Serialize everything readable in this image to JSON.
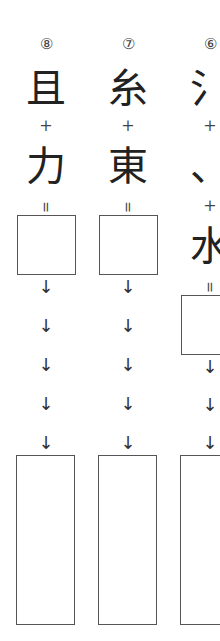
{
  "columns": [
    {
      "number": "⑧",
      "parts": [
        "且",
        "+",
        "力"
      ],
      "equals": "=",
      "arrow": "↓",
      "answer_box": "",
      "final_box": ""
    },
    {
      "number": "⑦",
      "parts": [
        "糸",
        "+",
        "東"
      ],
      "equals": "=",
      "arrow": "↓",
      "answer_box": "",
      "final_box": ""
    },
    {
      "number": "⑥",
      "parts": [
        "氵",
        "+",
        "、",
        "+",
        "水"
      ],
      "equals": "=",
      "arrow": "↓",
      "answer_box": "",
      "final_box": ""
    }
  ]
}
